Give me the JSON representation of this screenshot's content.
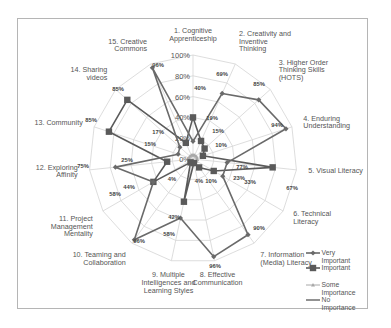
{
  "chart_data": {
    "type": "radar",
    "title": "",
    "categories": [
      "1. Cognitive Apprenticeship",
      "2. Creativity and Inventive Thinking",
      "3. Higher Order Thinking Skills (HOTS)",
      "4. Enduring Understanding",
      "5. Visual Literacy",
      "6. Technical Literacy",
      "7. Information (Media) Literacy",
      "8. Effective Communication",
      "9. Multiple Intelligences and Learning Styles",
      "10. Teaming and Collaboration",
      "11. Project Management Mentality",
      "12. Exploring Affinity",
      "13. Community",
      "14. Sharing videos",
      "15. Creative Commons"
    ],
    "category_lines": [
      [
        "1. Cognitive",
        "Apprenticeship"
      ],
      [
        "2. Creativity and",
        "Inventive",
        "Thinking"
      ],
      [
        "3. Higher Order",
        "Thinking Skills",
        "(HOTS)"
      ],
      [
        "4. Enduring",
        "Understanding"
      ],
      [
        "5. Visual Literacy"
      ],
      [
        "6. Technical",
        "Literacy"
      ],
      [
        "7. Information",
        "(Media) Literacy"
      ],
      [
        "8. Effective",
        "Communication"
      ],
      [
        "9. Multiple",
        "Intelligences and",
        "Learning Styles"
      ],
      [
        "10. Teaming and",
        "Collaboration"
      ],
      [
        "11. Project",
        "Management",
        "Mentality"
      ],
      [
        "12. Exploring",
        "Affinity"
      ],
      [
        "13. Community"
      ],
      [
        "14. Sharing",
        "videos"
      ],
      [
        "15. Creative",
        "Commons"
      ]
    ],
    "radial_ticks": [
      "0%",
      "20%",
      "40%",
      "60%",
      "80%",
      "100%"
    ],
    "rmax": 100,
    "series": [
      {
        "name": "Very Important",
        "marker": "diamond",
        "color": "#6a6a6a",
        "values": [
          17,
          69,
          85,
          94,
          33,
          33,
          90,
          96,
          58,
          96,
          44,
          75,
          15,
          17,
          96
        ]
      },
      {
        "name": "Important",
        "marker": "square",
        "color": "#5a5a5a",
        "values": [
          40,
          19,
          15,
          10,
          77,
          23,
          10,
          4,
          42,
          4,
          44,
          25,
          85,
          85,
          17
        ]
      },
      {
        "name": "Some Importance",
        "marker": "triangle",
        "color": "#a8a8a8",
        "values": [
          4,
          4,
          4,
          4,
          4,
          4,
          4,
          4,
          4,
          4,
          4,
          4,
          4,
          4,
          4
        ]
      },
      {
        "name": "No Importance",
        "marker": "none",
        "color": "#777777",
        "values": [
          0,
          0,
          0,
          0,
          0,
          0,
          0,
          0,
          0,
          0,
          0,
          0,
          0,
          0,
          0
        ]
      }
    ],
    "value_labels": [
      {
        "text": "40%",
        "x": 200,
        "y": 90
      },
      {
        "text": "69%",
        "x": 222,
        "y": 76
      },
      {
        "text": "85%",
        "x": 259,
        "y": 86
      },
      {
        "text": "94%",
        "x": 277,
        "y": 127
      },
      {
        "text": "77%",
        "x": 242,
        "y": 169
      },
      {
        "text": "67%",
        "x": 292,
        "y": 190
      },
      {
        "text": "23%",
        "x": 239,
        "y": 180
      },
      {
        "text": "33%",
        "x": 250,
        "y": 184
      },
      {
        "text": "90%",
        "x": 259,
        "y": 230
      },
      {
        "text": "96%",
        "x": 215,
        "y": 268
      },
      {
        "text": "10%",
        "x": 211,
        "y": 183
      },
      {
        "text": "4%",
        "x": 199,
        "y": 183
      },
      {
        "text": "4%",
        "x": 172,
        "y": 181
      },
      {
        "text": "58%",
        "x": 169,
        "y": 236
      },
      {
        "text": "42%",
        "x": 174,
        "y": 219
      },
      {
        "text": "96%",
        "x": 139,
        "y": 243
      },
      {
        "text": "58%",
        "x": 115,
        "y": 196
      },
      {
        "text": "44%",
        "x": 129,
        "y": 189
      },
      {
        "text": "75%",
        "x": 83,
        "y": 168
      },
      {
        "text": "25%",
        "x": 127,
        "y": 162
      },
      {
        "text": "85%",
        "x": 91,
        "y": 122
      },
      {
        "text": "15%",
        "x": 150,
        "y": 146
      },
      {
        "text": "85%",
        "x": 118,
        "y": 91
      },
      {
        "text": "17%",
        "x": 158,
        "y": 134
      },
      {
        "text": "96%",
        "x": 158,
        "y": 67
      },
      {
        "text": "19%",
        "x": 212,
        "y": 120
      },
      {
        "text": "15%",
        "x": 218,
        "y": 133
      },
      {
        "text": "10%",
        "x": 221,
        "y": 147
      }
    ],
    "legend": {
      "position": "bottom-right",
      "items": [
        {
          "lines": [
            "Very",
            "Important"
          ]
        },
        {
          "lines": [
            "Important"
          ]
        },
        {
          "lines": [
            "Some",
            "Importance"
          ]
        },
        {
          "lines": [
            "No",
            "Importance"
          ]
        }
      ]
    }
  }
}
